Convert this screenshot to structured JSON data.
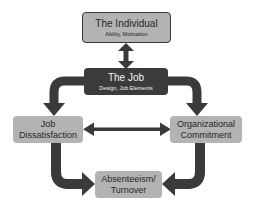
{
  "diagram": {
    "colors": {
      "arrow": "#3a3a3a",
      "light_node": "#b3b3b3",
      "dark_node": "#3b3b3b",
      "background": "#ffffff"
    },
    "nodes": {
      "individual": {
        "title": "The Individual",
        "subtitle": "Ability,  Motivation"
      },
      "job": {
        "title": "The Job",
        "subtitle": "Design, Job Elements"
      },
      "dissatisfaction": {
        "line1": "Job",
        "line2": "Dissatisfaction"
      },
      "commitment": {
        "line1": "Organizational",
        "line2": "Commitment"
      },
      "absenteeism": {
        "line1": "Absenteeism/",
        "line2": "Turnover"
      }
    },
    "edges": [
      {
        "from": "individual",
        "to": "job",
        "type": "bidirectional"
      },
      {
        "from": "job",
        "to": "dissatisfaction",
        "type": "directed"
      },
      {
        "from": "job",
        "to": "commitment",
        "type": "directed"
      },
      {
        "from": "dissatisfaction",
        "to": "commitment",
        "type": "bidirectional"
      },
      {
        "from": "dissatisfaction",
        "to": "absenteeism",
        "type": "directed"
      },
      {
        "from": "commitment",
        "to": "absenteeism",
        "type": "directed"
      }
    ]
  }
}
